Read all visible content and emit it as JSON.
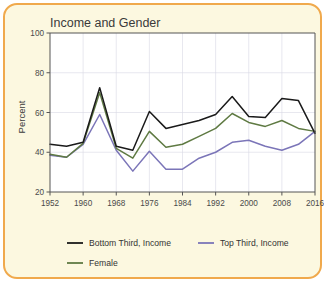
{
  "card": {
    "border_color": "#f0a94c",
    "background_color": "#fcf8e0"
  },
  "chart_data": {
    "type": "line",
    "title": "Income and Gender",
    "xlabel": "",
    "ylabel": "Percent",
    "ylim": [
      20,
      100
    ],
    "xlim": [
      1952,
      2016
    ],
    "grid": true,
    "legend_position": "bottom",
    "y_ticks": [
      100,
      80,
      60,
      40,
      20
    ],
    "x_ticks": [
      1952,
      1960,
      1968,
      1976,
      1984,
      1992,
      2000,
      2008,
      2016
    ],
    "x": [
      1952,
      1956,
      1960,
      1964,
      1968,
      1972,
      1976,
      1980,
      1984,
      1988,
      1992,
      1996,
      2000,
      2004,
      2008,
      2012,
      2016
    ],
    "series": [
      {
        "name": "Bottom Third, Income",
        "color": "#1a1a1a",
        "values": [
          44,
          43,
          45,
          72.5,
          43,
          41,
          60.5,
          52,
          54,
          56,
          59,
          68,
          58,
          57.5,
          67,
          66,
          49.5
        ]
      },
      {
        "name": "Top Third, Income",
        "color": "#7b75b8",
        "values": [
          38.5,
          37.5,
          44,
          59,
          41,
          30.5,
          40.5,
          31.5,
          31.5,
          37,
          40,
          45,
          46,
          43,
          41,
          44,
          50.5
        ]
      },
      {
        "name": "Female",
        "color": "#5f7a43",
        "values": [
          39,
          37.5,
          44.5,
          70,
          42,
          37,
          50.5,
          42.5,
          44,
          48,
          52,
          59.5,
          55,
          53,
          56,
          52,
          50.5
        ]
      }
    ]
  },
  "legend": {
    "items": [
      {
        "label": "Bottom Third, Income",
        "color": "#1a1a1a"
      },
      {
        "label": "Top Third, Income",
        "color": "#7b75b8"
      },
      {
        "label": "Female",
        "color": "#5f7a43"
      }
    ]
  }
}
